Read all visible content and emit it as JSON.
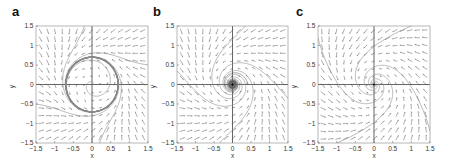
{
  "figure": {
    "panels": [
      "a",
      "b",
      "c"
    ]
  },
  "chart_data": [
    {
      "panel": "a",
      "type": "scatter",
      "subtype": "phase-portrait",
      "title": "",
      "xlabel": "x",
      "ylabel": "y",
      "xlim": [
        -1.5,
        1.5
      ],
      "ylim": [
        -1.5,
        1.5
      ],
      "xticks": [
        "-1.5",
        "-1",
        "-0.5",
        "0",
        "0.5",
        "1",
        "1.5"
      ],
      "yticks": [
        "-1.5",
        "-1",
        "-0.5",
        "0",
        "0.5",
        "1",
        "1.5"
      ],
      "grid": false,
      "features": {
        "vector_field": "quiver arrows on 15x15 grid",
        "limit_cycle_radius": 0.7,
        "inner_spiral": "trajectory spiraling out from origin to limit cycle",
        "outer_trajectories": "trajectories entering from corners converging to limit cycle"
      }
    },
    {
      "panel": "b",
      "type": "scatter",
      "subtype": "phase-portrait",
      "title": "",
      "xlabel": "x",
      "ylabel": "y",
      "xlim": [
        -1.5,
        1.5
      ],
      "ylim": [
        -1.5,
        1.5
      ],
      "xticks": [
        "-1.5",
        "-1",
        "-0.5",
        "0",
        "0.5",
        "1",
        "1.5"
      ],
      "yticks": [
        "-1.5",
        "-1",
        "-0.5",
        "0",
        "0.5",
        "1",
        "1.5"
      ],
      "grid": false,
      "features": {
        "vector_field": "quiver arrows on 15x15 grid",
        "equilibrium": "stable focus at origin with dense slow spiral (dark blob radius ~0.15)",
        "outer_trajectories": "two trajectories from edges spiraling into origin"
      }
    },
    {
      "panel": "c",
      "type": "scatter",
      "subtype": "phase-portrait",
      "title": "",
      "xlabel": "x",
      "ylabel": "y",
      "xlim": [
        -1.5,
        1.5
      ],
      "ylim": [
        -1.5,
        1.5
      ],
      "xticks": [
        "-1.5",
        "-1",
        "-0.5",
        "0",
        "0.5",
        "1",
        "1.5"
      ],
      "yticks": [
        "-1.5",
        "-1",
        "-0.5",
        "0",
        "0.5",
        "1",
        "1.5"
      ],
      "grid": false,
      "features": {
        "vector_field": "quiver arrows on 15x15 grid",
        "equilibrium": "stable focus at origin with tight spiral",
        "outer_trajectories": "four trajectories from corners/edges spiraling into origin"
      }
    }
  ]
}
